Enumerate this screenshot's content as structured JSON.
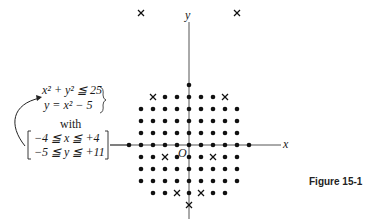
{
  "figure": {
    "caption": "Figure 15-1",
    "axes": {
      "x_label": "x",
      "y_label": "y",
      "origin_label": "O"
    },
    "system": {
      "eq1": "x² + y² ≦ 25",
      "eq2": "y = x² − 5",
      "connector": "with",
      "bound1": "−4 ≦ x ≦ +4",
      "bound2": "−5 ≦ y ≦ +11"
    },
    "grid": {
      "origin_px": [
        189,
        145
      ],
      "spacing_px": 12,
      "color": "#111111"
    }
  },
  "chart_data": {
    "type": "scatter",
    "title": "Figure 15-1",
    "xlabel": "x",
    "ylabel": "y",
    "series": [
      {
        "name": "lattice points with x^2 + y^2 <= 25",
        "marker": "dot",
        "points": [
          [
            0,
            5
          ],
          [
            -3,
            4
          ],
          [
            -2,
            4
          ],
          [
            -1,
            4
          ],
          [
            0,
            4
          ],
          [
            1,
            4
          ],
          [
            2,
            4
          ],
          [
            3,
            4
          ],
          [
            -4,
            3
          ],
          [
            -3,
            3
          ],
          [
            -2,
            3
          ],
          [
            -1,
            3
          ],
          [
            0,
            3
          ],
          [
            1,
            3
          ],
          [
            2,
            3
          ],
          [
            3,
            3
          ],
          [
            4,
            3
          ],
          [
            -4,
            2
          ],
          [
            -3,
            2
          ],
          [
            -2,
            2
          ],
          [
            -1,
            2
          ],
          [
            0,
            2
          ],
          [
            1,
            2
          ],
          [
            2,
            2
          ],
          [
            3,
            2
          ],
          [
            4,
            2
          ],
          [
            -4,
            1
          ],
          [
            -3,
            1
          ],
          [
            -2,
            1
          ],
          [
            -1,
            1
          ],
          [
            0,
            1
          ],
          [
            1,
            1
          ],
          [
            2,
            1
          ],
          [
            3,
            1
          ],
          [
            4,
            1
          ],
          [
            -5,
            0
          ],
          [
            -4,
            0
          ],
          [
            -3,
            0
          ],
          [
            -2,
            0
          ],
          [
            -1,
            0
          ],
          [
            0,
            0
          ],
          [
            1,
            0
          ],
          [
            2,
            0
          ],
          [
            3,
            0
          ],
          [
            4,
            0
          ],
          [
            5,
            0
          ],
          [
            -4,
            -1
          ],
          [
            -3,
            -1
          ],
          [
            -2,
            -1
          ],
          [
            -1,
            -1
          ],
          [
            0,
            -1
          ],
          [
            1,
            -1
          ],
          [
            2,
            -1
          ],
          [
            3,
            -1
          ],
          [
            4,
            -1
          ],
          [
            -4,
            -2
          ],
          [
            -3,
            -2
          ],
          [
            -2,
            -2
          ],
          [
            -1,
            -2
          ],
          [
            0,
            -2
          ],
          [
            1,
            -2
          ],
          [
            2,
            -2
          ],
          [
            3,
            -2
          ],
          [
            4,
            -2
          ],
          [
            -4,
            -3
          ],
          [
            -3,
            -3
          ],
          [
            -2,
            -3
          ],
          [
            -1,
            -3
          ],
          [
            0,
            -3
          ],
          [
            1,
            -3
          ],
          [
            2,
            -3
          ],
          [
            3,
            -3
          ],
          [
            4,
            -3
          ],
          [
            -3,
            -4
          ],
          [
            -2,
            -4
          ],
          [
            -1,
            -4
          ],
          [
            0,
            -4
          ],
          [
            1,
            -4
          ],
          [
            2,
            -4
          ],
          [
            3,
            -4
          ],
          [
            0,
            -5
          ]
        ]
      },
      {
        "name": "y = x^2 - 5 (integer x in [-4,4])",
        "marker": "cross",
        "points": [
          [
            -4,
            11
          ],
          [
            4,
            11
          ],
          [
            -3,
            4
          ],
          [
            3,
            4
          ],
          [
            -2,
            -1
          ],
          [
            2,
            -1
          ],
          [
            -1,
            -4
          ],
          [
            1,
            -4
          ],
          [
            0,
            -5
          ]
        ]
      }
    ],
    "xlim": [
      -5,
      5
    ],
    "ylim": [
      -5,
      11
    ],
    "grid": false,
    "legend": "none"
  }
}
